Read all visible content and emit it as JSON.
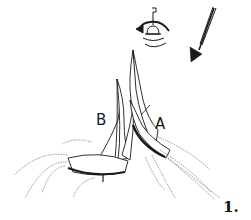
{
  "figure": {
    "number_label": "1.",
    "boat_labels": {
      "left": "B",
      "right": "A"
    },
    "icons": {
      "wind": "wind-arrow-icon",
      "mark": "bell-buoy-icon",
      "rounding": "rounding-direction-arrow-icon"
    },
    "colors": {
      "ink": "#1a1a1a",
      "background": "#ffffff"
    }
  }
}
